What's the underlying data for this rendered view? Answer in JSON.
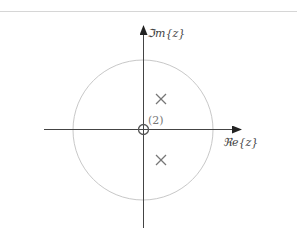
{
  "diagram": {
    "type": "pole-zero plot",
    "axes": {
      "x_label": "ℜe{z}",
      "y_label": "ℑm{z}"
    },
    "unit_circle": {
      "center": [
        143,
        130
      ],
      "radius": 70,
      "color": "#c8c8c8"
    },
    "zeros": [
      {
        "position": [
          143,
          130
        ],
        "multiplicity_label": "(2)"
      }
    ],
    "poles": [
      {
        "position": [
          161,
          99
        ]
      },
      {
        "position": [
          161,
          160
        ]
      }
    ],
    "colors": {
      "axis": "#333333",
      "circle": "#c8c8c8",
      "pole": "#777777",
      "zero": "#555555"
    }
  }
}
